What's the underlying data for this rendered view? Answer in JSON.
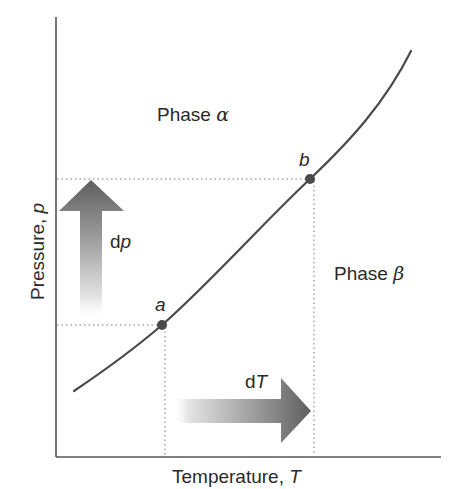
{
  "figure": {
    "type": "phase-diagram",
    "axes": {
      "x_label_text": "Temperature, ",
      "x_label_symbol": "T",
      "y_label_text": "Pressure, ",
      "y_label_symbol": "p"
    },
    "regions": {
      "upper_label_text": "Phase ",
      "upper_label_symbol": "α",
      "lower_label_text": "Phase ",
      "lower_label_symbol": "β"
    },
    "points": [
      {
        "label": "a"
      },
      {
        "label": "b"
      }
    ],
    "arrows": {
      "vertical": {
        "label_prefix": "d",
        "label_symbol": "p"
      },
      "horizontal": {
        "label_prefix": "d",
        "label_symbol": "T"
      }
    },
    "colors": {
      "axis": "#555555",
      "curve": "#4a4a4a",
      "point": "#4a4a4a",
      "guide": "#7a7a7a",
      "arrow_dark": "#5a5a5a",
      "arrow_light": "#ffffff",
      "text": "#2a2a2a"
    }
  }
}
